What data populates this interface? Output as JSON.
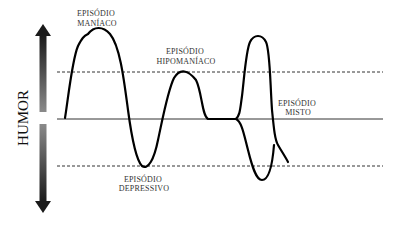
{
  "axis_label": "HUMOR",
  "labels": {
    "manic": [
      "EPISÓDIO",
      "MANÍACO"
    ],
    "hypomanic": [
      "EPISÓDIO",
      "HIPOMANÍACO"
    ],
    "depressive": [
      "EPISÓDIO",
      "DEPRESSIVO"
    ],
    "mixed": [
      "EPISÓDIO",
      "MISTO"
    ]
  },
  "lines": {
    "upper_threshold": "dashed",
    "baseline": "solid",
    "lower_threshold": "dashed"
  },
  "colors": {
    "curve": "#000000",
    "lines": "#333333",
    "arrow_dark": "#111111",
    "arrow_light": "#888888"
  }
}
